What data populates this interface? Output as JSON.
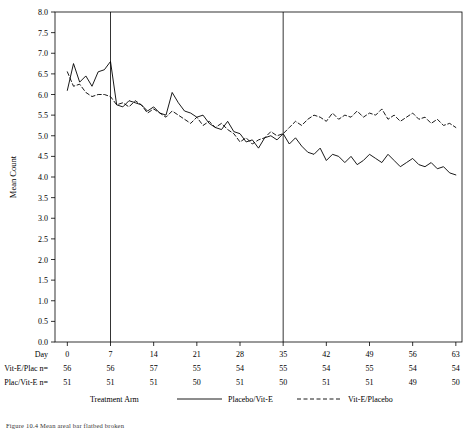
{
  "caption": "Figure 10.4   Mean areal bar flatbed broken",
  "chart_data": {
    "type": "line",
    "title": "",
    "xlabel": "Day",
    "ylabel": "Mean Count",
    "xlim": [
      -2,
      64
    ],
    "ylim": [
      0.0,
      8.0
    ],
    "grid": false,
    "legend_position": "bottom",
    "legend_title": "Treatment Arm",
    "x_ticks": [
      0,
      7,
      14,
      21,
      28,
      35,
      42,
      49,
      56,
      63
    ],
    "y_ticks": [
      "0.0",
      "0.5",
      "1.0",
      "1.5",
      "2.0",
      "2.5",
      "3.0",
      "3.5",
      "4.0",
      "4.5",
      "5.0",
      "5.5",
      "6.0",
      "6.5",
      "7.0",
      "7.5",
      "8.0"
    ],
    "vlines": [
      7,
      35
    ],
    "series": [
      {
        "name": "Placebo/Vit-E",
        "style": "solid",
        "x": [
          0,
          1,
          2,
          3,
          4,
          5,
          6,
          7,
          8,
          9,
          10,
          11,
          12,
          13,
          14,
          15,
          16,
          17,
          18,
          19,
          20,
          21,
          22,
          23,
          24,
          25,
          26,
          27,
          28,
          29,
          30,
          31,
          32,
          33,
          34,
          35,
          36,
          37,
          38,
          39,
          40,
          41,
          42,
          43,
          44,
          45,
          46,
          47,
          48,
          49,
          50,
          51,
          52,
          53,
          54,
          55,
          56,
          57,
          58,
          59,
          60,
          61,
          62,
          63
        ],
        "values": [
          6.1,
          6.75,
          6.3,
          6.45,
          6.2,
          6.55,
          6.6,
          6.8,
          5.75,
          5.7,
          5.85,
          5.8,
          5.75,
          5.6,
          5.7,
          5.55,
          5.5,
          6.05,
          5.8,
          5.6,
          5.55,
          5.45,
          5.5,
          5.3,
          5.2,
          5.15,
          5.35,
          5.1,
          5.05,
          4.85,
          4.9,
          4.7,
          4.95,
          5.0,
          4.9,
          5.05,
          4.8,
          4.95,
          4.75,
          4.6,
          4.55,
          4.7,
          4.4,
          4.55,
          4.5,
          4.35,
          4.5,
          4.3,
          4.4,
          4.55,
          4.45,
          4.35,
          4.55,
          4.4,
          4.25,
          4.35,
          4.45,
          4.3,
          4.25,
          4.35,
          4.2,
          4.25,
          4.1,
          4.05
        ]
      },
      {
        "name": "Vit-E/Placebo",
        "style": "dashed",
        "x": [
          0,
          1,
          2,
          3,
          4,
          5,
          6,
          7,
          8,
          9,
          10,
          11,
          12,
          13,
          14,
          15,
          16,
          17,
          18,
          19,
          20,
          21,
          22,
          23,
          24,
          25,
          26,
          27,
          28,
          29,
          30,
          31,
          32,
          33,
          34,
          35,
          36,
          37,
          38,
          39,
          40,
          41,
          42,
          43,
          44,
          45,
          46,
          47,
          48,
          49,
          50,
          51,
          52,
          53,
          54,
          55,
          56,
          57,
          58,
          59,
          60,
          61,
          62,
          63
        ],
        "values": [
          6.55,
          6.2,
          6.25,
          6.05,
          5.95,
          6.0,
          6.0,
          5.95,
          5.75,
          5.8,
          5.7,
          5.85,
          5.75,
          5.55,
          5.65,
          5.55,
          5.45,
          5.6,
          5.5,
          5.4,
          5.3,
          5.45,
          5.25,
          5.35,
          5.2,
          5.3,
          5.15,
          5.05,
          4.85,
          4.95,
          4.8,
          4.9,
          4.95,
          5.1,
          5.0,
          5.05,
          5.2,
          5.35,
          5.25,
          5.4,
          5.5,
          5.45,
          5.35,
          5.55,
          5.4,
          5.5,
          5.45,
          5.6,
          5.45,
          5.55,
          5.5,
          5.65,
          5.4,
          5.5,
          5.35,
          5.45,
          5.55,
          5.4,
          5.45,
          5.3,
          5.4,
          5.25,
          5.3,
          5.2
        ]
      }
    ],
    "n_rows": [
      {
        "label": "Day",
        "values": [
          "0",
          "7",
          "14",
          "21",
          "28",
          "35",
          "42",
          "49",
          "56",
          "63"
        ]
      },
      {
        "label": "Vit-E/Plac  n=",
        "values": [
          "56",
          "56",
          "57",
          "55",
          "54",
          "55",
          "54",
          "55",
          "54",
          "54"
        ]
      },
      {
        "label": "Plac/Vit-E  n=",
        "values": [
          "51",
          "51",
          "51",
          "50",
          "51",
          "50",
          "51",
          "51",
          "49",
          "50"
        ]
      }
    ],
    "legend": [
      {
        "label": "Treatment Arm",
        "style": "none"
      },
      {
        "label": "Placebo/Vit-E",
        "style": "solid"
      },
      {
        "label": "Vit-E/Placebo",
        "style": "dashed"
      }
    ]
  }
}
